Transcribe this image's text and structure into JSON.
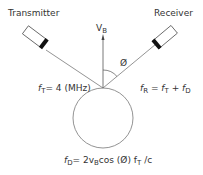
{
  "diagram": {
    "transmitter": {
      "label": "Transmitter"
    },
    "receiver": {
      "label": "Receiver"
    },
    "velocity": {
      "symbol": "V",
      "subscript": "B"
    },
    "angle": {
      "symbol": "Ø"
    },
    "transmit_freq": {
      "symbol": "f",
      "subscript": "T",
      "value": "= 4 (MHz)"
    },
    "receive_freq": {
      "symbol": "f",
      "subscript": "R",
      "eq": " = ",
      "t_symbol": "f",
      "t_sub": "T",
      "plus": " + ",
      "d_symbol": "f",
      "d_sub": "D"
    },
    "doppler_formula": {
      "lhs": "f",
      "lhs_sub": "D",
      "part1": "= 2v",
      "v_sub": "B",
      "part2": "cos (Ø) f",
      "ft_sub": "T",
      "part3": " /c"
    },
    "colors": {
      "line": "#555555",
      "transducer_tip": "#111111"
    }
  }
}
